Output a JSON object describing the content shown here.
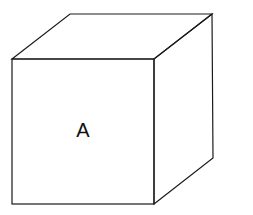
{
  "diagram": {
    "type": "cube",
    "front_face_label": "A",
    "stroke_color": "#1a1a1a",
    "background": "#ffffff"
  }
}
